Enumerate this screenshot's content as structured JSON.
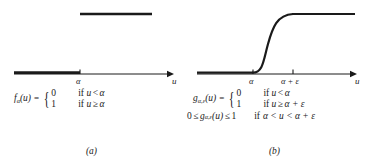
{
  "figure": {
    "background": "#ffffff",
    "ink": "#1a1a1a",
    "panels": [
      {
        "id": "a",
        "caption": "(a)",
        "axis": {
          "x_label": "u",
          "ticks": [
            {
              "label": "α",
              "x": 80
            }
          ]
        },
        "curve": {
          "type": "step",
          "description": "hard unit step: value 0 for u < alpha, value 1 for u >= alpha",
          "lower_segment": {
            "x0": 14,
            "x1": 80,
            "y": 1
          },
          "upper_segment": {
            "x0": 80,
            "x1": 152,
            "y": 0
          }
        },
        "equation": {
          "lhs": "f",
          "lhs_sub": "α",
          "lhs_arg": "(u)",
          "equals": "=",
          "cases": [
            {
              "value": "0",
              "cond_prefix": "if",
              "cond_var": "u",
              "cond_op": "<",
              "cond_rhs": "α"
            },
            {
              "value": "1",
              "cond_prefix": "if",
              "cond_var": "u",
              "cond_op": "≥",
              "cond_rhs": "α"
            }
          ]
        }
      },
      {
        "id": "b",
        "caption": "(b)",
        "axis": {
          "x_label": "u",
          "ticks": [
            {
              "label": "α",
              "x": 70
            },
            {
              "label": "α + ε",
              "x": 110
            }
          ]
        },
        "curve": {
          "type": "sigmoid",
          "description": "smooth monotone ramp: 0 for u < alpha, rises smoothly on (alpha, alpha+epsilon), 1 for u >= alpha+epsilon",
          "lower_segment": {
            "x0": 14,
            "x1": 70,
            "y": 1
          },
          "upper_segment": {
            "x0": 110,
            "x1": 172,
            "y": 0
          },
          "ramp_from_x": 70,
          "ramp_to_x": 110
        },
        "equation": {
          "lhs": "g",
          "lhs_sub": "α,ε",
          "lhs_arg": "(u)",
          "equals": "=",
          "cases": [
            {
              "value": "0",
              "cond_prefix": "if",
              "cond_var": "u",
              "cond_op": "<",
              "cond_rhs": "α"
            },
            {
              "value": "1",
              "cond_prefix": "if",
              "cond_var": "u",
              "cond_op": "≥",
              "cond_rhs": "α + ε"
            }
          ],
          "range_line": {
            "lower": "0",
            "op_left": "≤",
            "fn": "g",
            "fn_sub": "α,ε",
            "fn_arg": "(u)",
            "op_right": "≤",
            "upper": "1",
            "cond_prefix": "if",
            "cond": "α < u < α + ε"
          }
        }
      }
    ]
  }
}
